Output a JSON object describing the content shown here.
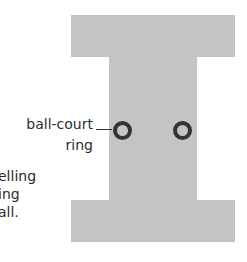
{
  "diagram": {
    "shape": "I-shaped ball court",
    "fill_color": "#c4c4c4",
    "ring_color": "#333333",
    "label": {
      "line1": "ball-court",
      "line2": "ring"
    },
    "rings": [
      {
        "name": "left",
        "cx": 122,
        "cy": 130
      },
      {
        "name": "right",
        "cx": 182,
        "cy": 130
      }
    ]
  },
  "caption_fragments": [
    "elling",
    "ing",
    "all."
  ]
}
